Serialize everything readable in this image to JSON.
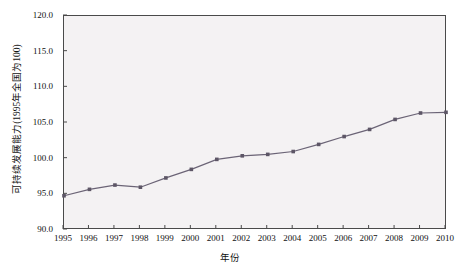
{
  "chart_data": {
    "type": "line",
    "title": "",
    "xlabel": "年份",
    "ylabel": "可持续发展能力(1995年全国为100)",
    "x": [
      1995,
      1996,
      1997,
      1998,
      1999,
      2000,
      2001,
      2002,
      2003,
      2004,
      2005,
      2006,
      2007,
      2008,
      2009,
      2010
    ],
    "categories": [
      "1995",
      "1996",
      "1997",
      "1998",
      "1999",
      "2000",
      "2001",
      "2002",
      "2003",
      "2004",
      "2005",
      "2006",
      "2007",
      "2008",
      "2009",
      "2010"
    ],
    "values": [
      94.8,
      95.7,
      96.3,
      96.0,
      97.3,
      98.5,
      99.9,
      100.4,
      100.6,
      101.0,
      102.0,
      103.1,
      104.1,
      105.5,
      106.4,
      106.5
    ],
    "series": [
      {
        "name": "可持续发展能力",
        "values": [
          94.8,
          95.7,
          96.3,
          96.0,
          97.3,
          98.5,
          99.9,
          100.4,
          100.6,
          101.0,
          102.0,
          103.1,
          104.1,
          105.5,
          106.4,
          106.5
        ],
        "color": "#6b6476",
        "marker": "square"
      }
    ],
    "ylim": [
      90.0,
      120.0
    ],
    "yticks": [
      90.0,
      95.0,
      100.0,
      105.0,
      110.0,
      115.0,
      120.0
    ],
    "ytick_labels": [
      "90.0",
      "95.0",
      "100.0",
      "105.0",
      "110.0",
      "115.0",
      "120.0"
    ],
    "xlim": [
      1995,
      2010
    ],
    "grid": false,
    "legend": "none",
    "plot_background": "#f4f2f3",
    "axis_color": "#4a4a4a",
    "line_color": "#6b6476",
    "marker_color": "#5d5666"
  }
}
